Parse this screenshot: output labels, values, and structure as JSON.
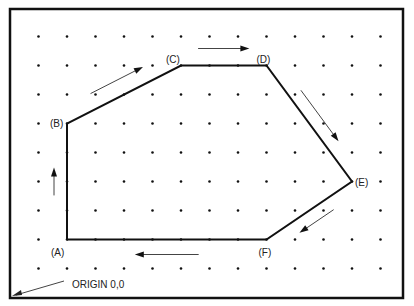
{
  "diagram": {
    "grid": {
      "columns": 13,
      "rows": 9
    },
    "points": [
      {
        "id": "A",
        "label": "(A)",
        "col": 1,
        "row": 7
      },
      {
        "id": "B",
        "label": "(B)",
        "col": 1,
        "row": 3
      },
      {
        "id": "C",
        "label": "(C)",
        "col": 5,
        "row": 1
      },
      {
        "id": "D",
        "label": "(D)",
        "col": 8,
        "row": 1
      },
      {
        "id": "E",
        "label": "(E)",
        "col": 11,
        "row": 5
      },
      {
        "id": "F",
        "label": "(F)",
        "col": 8,
        "row": 7
      }
    ],
    "path_order": [
      "A",
      "B",
      "C",
      "D",
      "E",
      "F",
      "A"
    ],
    "direction_arrows": [
      {
        "from": "A",
        "to": "B"
      },
      {
        "from": "B",
        "to": "C"
      },
      {
        "from": "C",
        "to": "D"
      },
      {
        "from": "D",
        "to": "E"
      },
      {
        "from": "E",
        "to": "F"
      },
      {
        "from": "F",
        "to": "A"
      }
    ],
    "origin_label": "ORIGIN 0,0",
    "colors": {
      "line": "#111111",
      "dot": "#111111",
      "arrow": "#444444",
      "border": "#111111"
    }
  }
}
